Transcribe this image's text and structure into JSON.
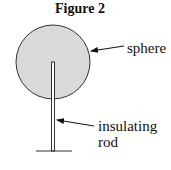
{
  "figure": {
    "title": "Figure 2",
    "labels": {
      "sphere": "sphere",
      "rod_line1": "insulating",
      "rod_line2": "rod"
    },
    "colors": {
      "sphere_fill": "#d9d9d9",
      "stroke": "#333333"
    }
  }
}
